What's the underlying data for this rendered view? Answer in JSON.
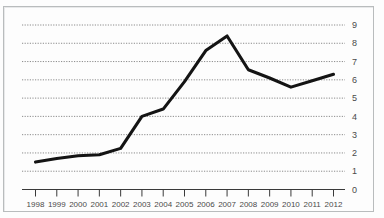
{
  "chart_data": {
    "type": "line",
    "title": "",
    "subtitle": "",
    "xlabel": "",
    "ylabel": "",
    "categories": [
      "1998",
      "1999",
      "2000",
      "2001",
      "2002",
      "2003",
      "2004",
      "2005",
      "2006",
      "2007",
      "2008",
      "2009",
      "2010",
      "2011",
      "2012"
    ],
    "values": [
      1.5,
      1.7,
      1.85,
      1.9,
      2.25,
      4.0,
      4.4,
      5.9,
      7.6,
      8.4,
      6.55,
      6.1,
      5.6,
      5.95,
      6.3
    ],
    "series": [
      {
        "name": "series-1",
        "values": [
          1.5,
          1.7,
          1.85,
          1.9,
          2.25,
          4.0,
          4.4,
          5.9,
          7.6,
          8.4,
          6.55,
          6.1,
          5.6,
          5.95,
          6.3
        ],
        "color": "#141414"
      }
    ],
    "ylim": [
      0,
      9
    ],
    "yticks": [
      0,
      1,
      2,
      3,
      4,
      5,
      6,
      7,
      8,
      9
    ],
    "ytick_labels": [
      "0",
      "1",
      "2",
      "3",
      "4",
      "5",
      "6",
      "7",
      "8",
      "9"
    ],
    "xticks": [
      "1998",
      "1999",
      "2000",
      "2001",
      "2002",
      "2003",
      "2004",
      "2005",
      "2006",
      "2007",
      "2008",
      "2009",
      "2010",
      "2011",
      "2012"
    ],
    "grid": true,
    "grid_style": "dotted-horizontal",
    "legend": false,
    "legend_position": "none",
    "annotations": []
  },
  "axis": {
    "y_labels": [
      "9",
      "8",
      "7",
      "6",
      "5",
      "4",
      "3",
      "2",
      "1",
      "0"
    ],
    "x_labels": [
      "1998",
      "1999",
      "2000",
      "2001",
      "2002",
      "2003",
      "2004",
      "2005",
      "2006",
      "2007",
      "2008",
      "2009",
      "2010",
      "2011",
      "2012"
    ]
  },
  "colors": {
    "line": "#141414",
    "grid": "#6f6f6f",
    "axis": "#3a3a3a",
    "label": "#4a4a4a",
    "page_background": "#fdfdfd",
    "frame_border": "#b9bcbd"
  }
}
